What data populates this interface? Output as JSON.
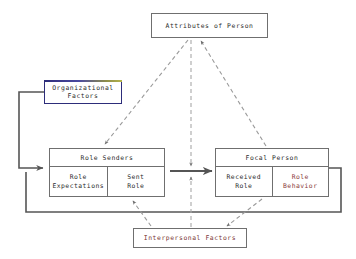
{
  "diagram": {
    "palette": {
      "box_border": "#6f6f6f",
      "org_border": "#2d2d7a",
      "solid_line": "#555555",
      "dashed_line": "#9a9a9a",
      "text": "#2b2b2b",
      "accent_text": "#8a3a3a",
      "background": "#ffffff"
    },
    "nodes": [
      {
        "id": "attributes",
        "label": "Attributes of Person",
        "type": "single-box"
      },
      {
        "id": "organizational",
        "label": "Organizational\nFactors",
        "type": "single-box"
      },
      {
        "id": "role_senders",
        "label": "Role Senders",
        "type": "split-box",
        "cells": [
          {
            "label": "Role\nExpectations"
          },
          {
            "label": "Sent\nRole"
          }
        ]
      },
      {
        "id": "focal_person",
        "label": "Focal Person",
        "type": "split-box",
        "cells": [
          {
            "label": "Received\nRole"
          },
          {
            "label": "Role\nBehavior"
          }
        ]
      },
      {
        "id": "interpersonal",
        "label": "Interpersonal Factors",
        "type": "single-box"
      }
    ],
    "edges": [
      {
        "id": "senders-to-focal",
        "style": "solid",
        "from": "role_senders",
        "to": "focal_person"
      },
      {
        "id": "org-to-senders",
        "style": "solid",
        "from": "organizational",
        "to": "role_senders"
      },
      {
        "id": "behavior-feedback-to-senders",
        "style": "solid",
        "from": "focal_person",
        "to": "role_senders"
      },
      {
        "id": "attributes-to-senders",
        "style": "dashed",
        "from": "attributes",
        "to": "role_senders"
      },
      {
        "id": "focal-to-attributes",
        "style": "dashed",
        "from": "focal_person",
        "to": "attributes"
      },
      {
        "id": "attributes-to-middle",
        "style": "dashed",
        "from": "attributes",
        "to": "senders-to-focal"
      },
      {
        "id": "interpersonal-to-middle",
        "style": "dashed",
        "from": "interpersonal",
        "to": "senders-to-focal"
      },
      {
        "id": "interpersonal-to-senders",
        "style": "dashed",
        "from": "interpersonal",
        "to": "role_senders"
      },
      {
        "id": "focal-to-interpersonal",
        "style": "dashed",
        "from": "focal_person",
        "to": "interpersonal"
      }
    ]
  }
}
